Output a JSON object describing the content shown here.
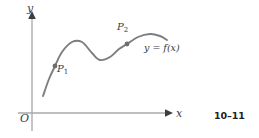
{
  "figure": {
    "kind": "math-graph-figure",
    "background_color": "#ffffff",
    "page_reference": "10–11",
    "axes": {
      "color": "#a8a8a8",
      "arrow_color": "#3d3d3d",
      "origin_label": "O",
      "x_axis_label": "x",
      "y_axis_label": "y",
      "x_axis": {
        "y_px": 113,
        "x_start_px": 18,
        "x_end_px": 173
      },
      "y_axis": {
        "x_px": 32,
        "y_top_px": 11,
        "y_bottom_px": 131
      }
    },
    "curve": {
      "label": "y = f(x)",
      "color": "#7d7d7d",
      "stroke_width": 1.9,
      "path_points": [
        [
          43,
          96
        ],
        [
          49,
          79
        ],
        [
          55,
          66
        ],
        [
          62,
          52
        ],
        [
          72,
          42
        ],
        [
          82,
          42
        ],
        [
          92,
          53
        ],
        [
          100,
          60
        ],
        [
          110,
          57
        ],
        [
          119,
          49
        ],
        [
          127,
          44
        ],
        [
          138,
          37
        ],
        [
          150,
          34
        ],
        [
          160,
          36
        ],
        [
          167,
          40
        ]
      ]
    },
    "points": [
      {
        "name": "P1",
        "label": "P",
        "subscript": "1",
        "marker_x_px": 55,
        "marker_y_px": 66,
        "marker_color": "#6e6e6e",
        "marker_radius": 2.4
      },
      {
        "name": "P2",
        "label": "P",
        "subscript": "2",
        "marker_x_px": 127,
        "marker_y_px": 44,
        "marker_color": "#6e6e6e",
        "marker_radius": 2.4
      }
    ]
  },
  "chart_data": {
    "type": "line",
    "title": "",
    "xlabel": "x",
    "ylabel": "y",
    "legend": [
      "y = f(x)"
    ],
    "grid": false,
    "annotations": [
      "P₁",
      "P₂",
      "O",
      "y = f(x)",
      "10–11"
    ],
    "xlim": [
      0,
      1
    ],
    "ylim": [
      0,
      1
    ],
    "series": [
      {
        "name": "y = f(x)",
        "x": [
          0.072,
          0.11,
          0.163,
          0.208,
          0.273,
          0.338,
          0.39,
          0.442,
          0.506,
          0.565,
          0.617,
          0.688,
          0.766,
          0.831,
          0.876
        ],
        "y": [
          0.167,
          0.313,
          0.426,
          0.53,
          0.617,
          0.617,
          0.522,
          0.461,
          0.487,
          0.557,
          0.6,
          0.661,
          0.687,
          0.67,
          0.635
        ]
      }
    ],
    "marked_points": [
      {
        "label": "P₁",
        "x": 0.163,
        "y": 0.426
      },
      {
        "label": "P₂",
        "x": 0.617,
        "y": 0.6
      }
    ]
  }
}
